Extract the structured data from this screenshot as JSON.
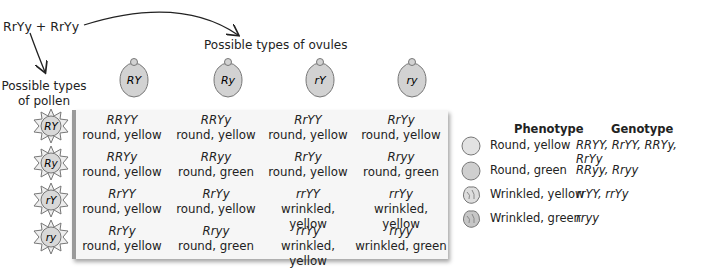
{
  "cross": {
    "label": "RrYy + RrYy"
  },
  "pollen_label": {
    "line1": "Possible types",
    "line2": "of pollen"
  },
  "ovule_label": "Possible types of ovules",
  "ovules": [
    "RY",
    "Ry",
    "rY",
    "ry"
  ],
  "pollen": [
    "RY",
    "Ry",
    "rY",
    "ry"
  ],
  "grid": [
    [
      {
        "g": "RRYY",
        "p": "round, yellow"
      },
      {
        "g": "RRYy",
        "p": "round, yellow"
      },
      {
        "g": "RrYY",
        "p": "round, yellow"
      },
      {
        "g": "RrYy",
        "p": "round, yellow"
      }
    ],
    [
      {
        "g": "RRYy",
        "p": "round, yellow"
      },
      {
        "g": "RRyy",
        "p": "round, green"
      },
      {
        "g": "RrYy",
        "p": "round, yellow"
      },
      {
        "g": "Rryy",
        "p": "round, green"
      }
    ],
    [
      {
        "g": "RrYY",
        "p": "round, yellow"
      },
      {
        "g": "RrYy",
        "p": "round, yellow"
      },
      {
        "g": "rrYY",
        "p": "wrinkled, yellow"
      },
      {
        "g": "rrYy",
        "p": "wrinkled, yellow"
      }
    ],
    [
      {
        "g": "RrYy",
        "p": "round, yellow"
      },
      {
        "g": "Rryy",
        "p": "round, green"
      },
      {
        "g": "rrYy",
        "p": "wrinkled, yellow"
      },
      {
        "g": "rryy",
        "p": "wrinkled, green"
      }
    ]
  ],
  "legend": {
    "phenotype_header": "Phenotype",
    "genotype_header": "Genotype",
    "rows": [
      {
        "phenotype": "Round, yellow",
        "genotype": "RRYY, RrYY, RRYy, RrYy",
        "icon": "round-seed-icon"
      },
      {
        "phenotype": "Round, green",
        "genotype": "RRyy, Rryy",
        "icon": "round-seed-icon"
      },
      {
        "phenotype": "Wrinkled, yellow",
        "genotype": "rrYY, rrYy",
        "icon": "wrinkled-seed-icon"
      },
      {
        "phenotype": "Wrinkled, green",
        "genotype": "rryy",
        "icon": "wrinkled-seed-icon"
      }
    ]
  },
  "colors": {
    "grid_bg": "#f6f6f6",
    "grid_border": "#9a9a9a",
    "seed_fill": "#d4d4d4"
  }
}
